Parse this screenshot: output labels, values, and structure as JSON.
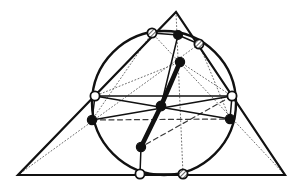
{
  "figure": {
    "width": 300,
    "height": 188,
    "background": "#ffffff",
    "ink_color": "#111111",
    "gray_fill": "#9a9a9a",
    "white_fill": "#ffffff",
    "black_fill": "#101010"
  },
  "triangle": {
    "name": "outer-triangle",
    "stroke": "#111111",
    "stroke_width": 2.2,
    "vertices": [
      {
        "id": "A",
        "x": 176,
        "y": 12,
        "label": "apex"
      },
      {
        "id": "B",
        "x": 18,
        "y": 175,
        "label": "bottom-left"
      },
      {
        "id": "C",
        "x": 285,
        "y": 175,
        "label": "bottom-right"
      }
    ]
  },
  "circle": {
    "name": "main-circle",
    "cx": 164,
    "cy": 103,
    "r": 72,
    "stroke": "#111111",
    "stroke_width": 2.4,
    "fill": "none"
  },
  "points": {
    "hollow": [
      {
        "id": "P1",
        "x": 95,
        "y": 96,
        "r": 4.6,
        "note": "left circle-triangle vertex"
      },
      {
        "id": "P2",
        "x": 232,
        "y": 96,
        "r": 4.6,
        "note": "right circle-triangle vertex"
      },
      {
        "id": "P3",
        "x": 140,
        "y": 174,
        "r": 4.6,
        "note": "bottom circle-triangle vertex"
      }
    ],
    "solid": [
      {
        "id": "Q1",
        "x": 178,
        "y": 35,
        "r": 4.4,
        "note": "top arc point"
      },
      {
        "id": "Q2",
        "x": 180,
        "y": 62,
        "r": 4.6,
        "note": "upper interior point"
      },
      {
        "id": "Q3",
        "x": 161,
        "y": 106,
        "r": 4.8,
        "note": "central point"
      },
      {
        "id": "Q4",
        "x": 141,
        "y": 147,
        "r": 4.6,
        "note": "lower interior point"
      },
      {
        "id": "Q5",
        "x": 92,
        "y": 120,
        "r": 4.6,
        "note": "lower-left point"
      },
      {
        "id": "Q6",
        "x": 230,
        "y": 119,
        "r": 4.6,
        "note": "lower-right point"
      }
    ],
    "hatched": [
      {
        "id": "H1",
        "x": 152,
        "y": 33,
        "r": 4.6,
        "note": "upper-left arc point"
      },
      {
        "id": "H2",
        "x": 199,
        "y": 44,
        "r": 4.6,
        "note": "upper-right arc point"
      },
      {
        "id": "H3",
        "x": 183,
        "y": 174,
        "r": 4.6,
        "note": "bottom arc point"
      }
    ]
  },
  "segments": {
    "solid_thin": [
      {
        "name": "seg-left-to-rightlower",
        "x1": 95,
        "y1": 96,
        "x2": 230,
        "y2": 119
      },
      {
        "name": "seg-right-to-leftlower",
        "x1": 232,
        "y1": 96,
        "x2": 92,
        "y2": 120
      },
      {
        "name": "seg-left-to-right",
        "x1": 95,
        "y1": 96,
        "x2": 232,
        "y2": 96
      },
      {
        "name": "seg-leftv-to-leftlower",
        "x1": 95,
        "y1": 96,
        "x2": 92,
        "y2": 120
      },
      {
        "name": "seg-rightv-to-rightlower",
        "x1": 232,
        "y1": 96,
        "x2": 230,
        "y2": 119
      },
      {
        "name": "seg-top-to-leftarc",
        "x1": 178,
        "y1": 35,
        "x2": 152,
        "y2": 33
      },
      {
        "name": "seg-top-to-rightarc",
        "x1": 178,
        "y1": 35,
        "x2": 199,
        "y2": 44
      },
      {
        "name": "seg-top-to-center",
        "x1": 178,
        "y1": 35,
        "x2": 161,
        "y2": 106
      },
      {
        "name": "seg-bottomhollow-to-low",
        "x1": 140,
        "y1": 174,
        "x2": 141,
        "y2": 147
      },
      {
        "name": "seg-bottom-chord",
        "x1": 140,
        "y1": 174,
        "x2": 183,
        "y2": 174
      }
    ],
    "solid_thick": [
      {
        "name": "seg-upper-thick",
        "x1": 180,
        "y1": 62,
        "x2": 161,
        "y2": 106
      },
      {
        "name": "seg-lower-thick",
        "x1": 161,
        "y1": 106,
        "x2": 141,
        "y2": 147
      }
    ],
    "dotted": [
      {
        "name": "dot-cevian-from-apex",
        "x1": 176,
        "y1": 12,
        "x2": 183,
        "y2": 174
      },
      {
        "name": "dot-cevian-from-bottomleft",
        "x1": 18,
        "y1": 175,
        "x2": 199,
        "y2": 44
      },
      {
        "name": "dot-cevian-from-bottomright",
        "x1": 285,
        "y1": 175,
        "x2": 152,
        "y2": 33
      },
      {
        "name": "dot-leftarc-to-lowerleft",
        "x1": 152,
        "y1": 33,
        "x2": 92,
        "y2": 120
      },
      {
        "name": "dot-rightarc-to-lowerright",
        "x1": 199,
        "y1": 44,
        "x2": 230,
        "y2": 119
      },
      {
        "name": "dot-upperpt-to-leftv",
        "x1": 180,
        "y1": 62,
        "x2": 95,
        "y2": 96
      },
      {
        "name": "dot-upperpt-to-rightv",
        "x1": 180,
        "y1": 62,
        "x2": 232,
        "y2": 96
      }
    ],
    "dashed": [
      {
        "name": "dash-leftlower-to-rightlower",
        "x1": 92,
        "y1": 120,
        "x2": 230,
        "y2": 119
      },
      {
        "name": "dash-center-to-lowleft",
        "x1": 232,
        "y1": 96,
        "x2": 141,
        "y2": 147
      }
    ]
  }
}
